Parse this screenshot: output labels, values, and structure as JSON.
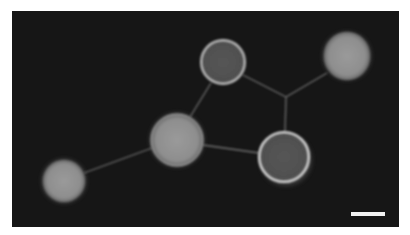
{
  "image": {
    "description": "Fluorescence micrograph of five spherical vesicles connected by thin membrane tubes on a dark background, with a white scale bar in the lower-right corner",
    "background_color": "#161616",
    "scale_bar": {
      "label": "",
      "color": "#f2f2f2"
    },
    "vesicles": [
      {
        "name": "vesicle-top-center",
        "appearance": "dark-interior-bright-rim"
      },
      {
        "name": "vesicle-top-right",
        "appearance": "bright-filled"
      },
      {
        "name": "vesicle-middle",
        "appearance": "bright-filled"
      },
      {
        "name": "vesicle-lower-right",
        "appearance": "dark-interior-bright-rim"
      },
      {
        "name": "vesicle-lower-left",
        "appearance": "bright-filled"
      }
    ],
    "tubes": [
      {
        "from": "vesicle-lower-left",
        "to": "vesicle-middle"
      },
      {
        "from": "vesicle-middle",
        "to": "vesicle-top-center"
      },
      {
        "from": "vesicle-middle",
        "to": "vesicle-lower-right"
      },
      {
        "from": "vesicle-top-center",
        "to": "junction"
      },
      {
        "from": "vesicle-top-right",
        "to": "junction"
      },
      {
        "from": "junction",
        "to": "vesicle-lower-right"
      }
    ]
  }
}
